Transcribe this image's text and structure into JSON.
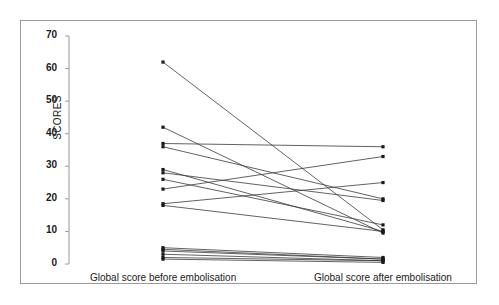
{
  "chart_data": {
    "type": "line",
    "title": "",
    "subtitle": "",
    "xlabel": "",
    "ylabel": "SCORES",
    "categories": [
      "Global score before embolisation",
      "Global score after embolisation"
    ],
    "ylim": [
      0,
      70
    ],
    "yticks": [
      0,
      10,
      20,
      30,
      40,
      50,
      60,
      70
    ],
    "ytick_labels": [
      "0",
      "10",
      "20",
      "30",
      "40",
      "50",
      "60",
      "70"
    ],
    "grid": false,
    "legend": "none",
    "marker": "square",
    "line_color": "#3a3a3a",
    "marker_color": "#1a1a1a",
    "axis_color": "#9a9a9a",
    "series": [
      {
        "name": "patient-1",
        "values": [
          62.0,
          10.5
        ]
      },
      {
        "name": "patient-2",
        "values": [
          42.0,
          9.5
        ]
      },
      {
        "name": "patient-3",
        "values": [
          37.0,
          36.0
        ]
      },
      {
        "name": "patient-4",
        "values": [
          36.0,
          20.0
        ]
      },
      {
        "name": "patient-5",
        "values": [
          29.0,
          10.0
        ]
      },
      {
        "name": "patient-6",
        "values": [
          28.0,
          19.5
        ]
      },
      {
        "name": "patient-7",
        "values": [
          26.0,
          12.0
        ]
      },
      {
        "name": "patient-8",
        "values": [
          23.0,
          33.0
        ]
      },
      {
        "name": "patient-9",
        "values": [
          18.5,
          25.0
        ]
      },
      {
        "name": "patient-10",
        "values": [
          18.0,
          10.0
        ]
      },
      {
        "name": "patient-11",
        "values": [
          5.0,
          2.0
        ]
      },
      {
        "name": "patient-12",
        "values": [
          4.5,
          1.5
        ]
      },
      {
        "name": "patient-13",
        "values": [
          4.0,
          1.5
        ]
      },
      {
        "name": "patient-14",
        "values": [
          3.0,
          1.0
        ]
      },
      {
        "name": "patient-15",
        "values": [
          2.0,
          1.0
        ]
      },
      {
        "name": "patient-16",
        "values": [
          1.5,
          0.5
        ]
      }
    ]
  }
}
